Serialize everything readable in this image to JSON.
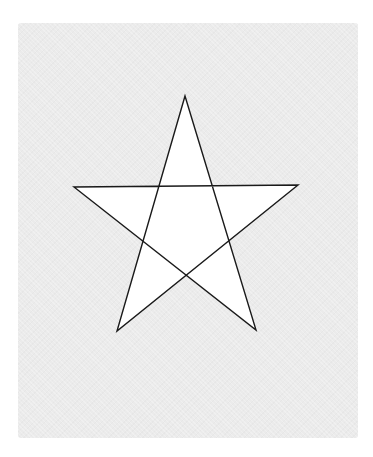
{
  "figure": {
    "type": "pentagram",
    "colors": {
      "background": "#ffffff",
      "paper": "#ebebeb",
      "star_fill": "#ffffff",
      "stroke": "#1a1a1a"
    },
    "stroke_width": 1.4,
    "vertices": {
      "top": [
        185,
        96
      ],
      "left": [
        74,
        187
      ],
      "right": [
        298,
        185
      ],
      "bottom_left": [
        117,
        331
      ],
      "bottom_right": [
        256,
        330
      ]
    }
  }
}
